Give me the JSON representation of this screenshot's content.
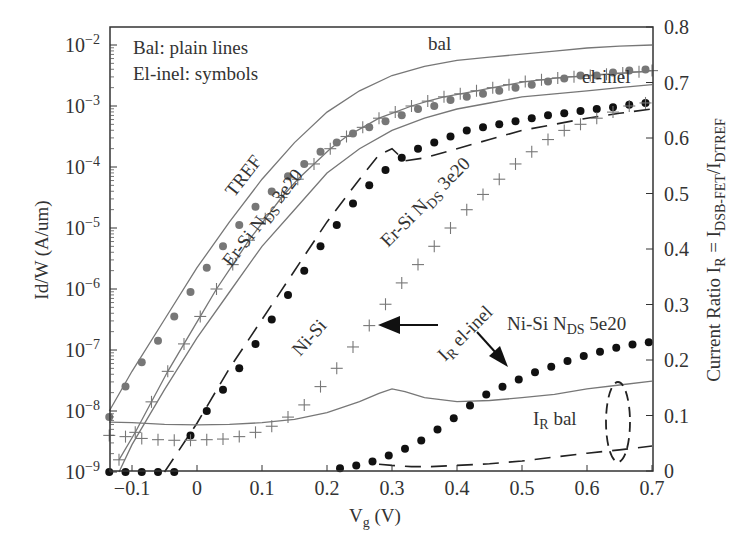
{
  "chart_data": {
    "type": "line",
    "title": "",
    "legend_note": [
      "Bal: plain lines",
      "El-inel: symbols"
    ],
    "xlabel": "V_g (V)",
    "ylabel_left": "Id/W (A/um)",
    "ylabel_right": "Current Ratio I_R = I_DSB-FET/I_DTREF",
    "xlim": [
      -0.135,
      0.7
    ],
    "ylim_left_log": [
      1e-09,
      0.01
    ],
    "ylim_right": [
      0,
      0.8
    ],
    "x_ticks": [
      -0.1,
      0,
      0.1,
      0.2,
      0.3,
      0.4,
      0.5,
      0.6,
      0.7
    ],
    "x_tick_labels": [
      "−0.1",
      "0",
      "0.1",
      "0.2",
      "0.3",
      "0.4",
      "0.5",
      "0.6",
      "0.7"
    ],
    "y_left_ticks": [
      -2,
      -3,
      -4,
      -5,
      -6,
      -7,
      -8,
      -9
    ],
    "y_right_ticks": [
      0,
      0.1,
      0.2,
      0.3,
      0.4,
      0.5,
      0.6,
      0.7,
      0.8
    ],
    "y_right_tick_labels": [
      "0",
      "0.1",
      "0.2",
      "0.3",
      "0.4",
      "0.5",
      "0.6",
      "0.7",
      "0.8"
    ],
    "grid": false,
    "series": [
      {
        "name": "TREF bal",
        "axis": "left",
        "style": "solid",
        "color": "#777777",
        "x": [
          -0.135,
          -0.1,
          -0.05,
          0,
          0.05,
          0.1,
          0.15,
          0.2,
          0.25,
          0.3,
          0.35,
          0.4,
          0.45,
          0.5,
          0.55,
          0.6,
          0.65,
          0.7
        ],
        "log10y": [
          -8.0,
          -7.35,
          -6.5,
          -5.65,
          -4.9,
          -4.2,
          -3.6,
          -3.1,
          -2.75,
          -2.5,
          -2.35,
          -2.25,
          -2.2,
          -2.15,
          -2.1,
          -2.05,
          -2.02,
          -2.0
        ]
      },
      {
        "name": "TREF el-inel",
        "axis": "left",
        "style": "dot-grey",
        "color": "#777777",
        "x": [
          -0.135,
          -0.11,
          -0.085,
          -0.06,
          -0.035,
          -0.01,
          0.015,
          0.04,
          0.065,
          0.09,
          0.115,
          0.14,
          0.165,
          0.19,
          0.215,
          0.24,
          0.265,
          0.29,
          0.315,
          0.34,
          0.365,
          0.39,
          0.415,
          0.44,
          0.465,
          0.49,
          0.515,
          0.54,
          0.565,
          0.59,
          0.615,
          0.64,
          0.665,
          0.69
        ],
        "log10y": [
          -8.1,
          -7.6,
          -7.2,
          -6.85,
          -6.45,
          -6.05,
          -5.65,
          -5.3,
          -4.95,
          -4.65,
          -4.4,
          -4.15,
          -3.95,
          -3.75,
          -3.6,
          -3.45,
          -3.35,
          -3.25,
          -3.15,
          -3.05,
          -3.0,
          -2.9,
          -2.85,
          -2.8,
          -2.75,
          -2.7,
          -2.65,
          -2.6,
          -2.55,
          -2.5,
          -2.5,
          -2.45,
          -2.42,
          -2.4
        ]
      },
      {
        "name": "Er-Si N_DS 3e20 (high) bal",
        "axis": "left",
        "style": "solid",
        "color": "#777777",
        "x": [
          -0.12,
          -0.1,
          -0.05,
          0,
          0.05,
          0.1,
          0.15,
          0.2,
          0.25,
          0.3,
          0.35,
          0.4,
          0.45,
          0.5,
          0.55,
          0.6,
          0.65,
          0.7
        ],
        "log10y": [
          -9.0,
          -8.55,
          -7.65,
          -6.8,
          -6.05,
          -5.3,
          -4.7,
          -4.1,
          -3.7,
          -3.4,
          -3.2,
          -3.05,
          -2.95,
          -2.85,
          -2.8,
          -2.75,
          -2.7,
          -2.65
        ]
      },
      {
        "name": "Er-Si N_DS 3e20 (high) el-inel",
        "axis": "left",
        "style": "plus-line",
        "color": "#777777",
        "x": [
          -0.12,
          -0.095,
          -0.07,
          -0.045,
          -0.02,
          0.005,
          0.03,
          0.055,
          0.08,
          0.105,
          0.13,
          0.155,
          0.18,
          0.205,
          0.23,
          0.255,
          0.28,
          0.305,
          0.33,
          0.355,
          0.38,
          0.405,
          0.43,
          0.455,
          0.48,
          0.505,
          0.53,
          0.555,
          0.58,
          0.605,
          0.63,
          0.655,
          0.68,
          0.7
        ],
        "log10y": [
          -8.8,
          -8.35,
          -7.85,
          -7.35,
          -6.9,
          -6.45,
          -6.0,
          -5.6,
          -5.2,
          -4.85,
          -4.5,
          -4.2,
          -3.95,
          -3.7,
          -3.5,
          -3.35,
          -3.2,
          -3.1,
          -3.0,
          -2.92,
          -2.85,
          -2.8,
          -2.75,
          -2.7,
          -2.65,
          -2.6,
          -2.57,
          -2.54,
          -2.52,
          -2.5,
          -2.48,
          -2.46,
          -2.44,
          -2.42
        ]
      },
      {
        "name": "Ni-Si bal",
        "axis": "left",
        "style": "dashed",
        "color": "#222222",
        "x": [
          -0.05,
          0,
          0.05,
          0.1,
          0.15,
          0.2,
          0.25,
          0.28,
          0.3,
          0.32,
          0.35,
          0.4,
          0.45,
          0.5,
          0.55,
          0.6,
          0.65,
          0.7
        ],
        "log10y": [
          -9.0,
          -8.2,
          -7.3,
          -6.5,
          -5.7,
          -4.9,
          -4.2,
          -3.8,
          -3.7,
          -3.9,
          -3.85,
          -3.7,
          -3.55,
          -3.4,
          -3.3,
          -3.2,
          -3.12,
          -3.05
        ]
      },
      {
        "name": "Ni-Si el-inel",
        "axis": "left",
        "style": "dot-black",
        "color": "#111111",
        "x": [
          -0.135,
          -0.11,
          -0.085,
          -0.06,
          -0.035,
          -0.01,
          0.015,
          0.04,
          0.065,
          0.09,
          0.115,
          0.14,
          0.165,
          0.19,
          0.215,
          0.24,
          0.265,
          0.29,
          0.315,
          0.34,
          0.365,
          0.39,
          0.415,
          0.44,
          0.465,
          0.49,
          0.515,
          0.54,
          0.565,
          0.59,
          0.615,
          0.64,
          0.665,
          0.69
        ],
        "log10y": [
          -9.0,
          -9.0,
          -9.0,
          -9.0,
          -9.0,
          -8.4,
          -8.0,
          -7.65,
          -7.3,
          -6.9,
          -6.5,
          -6.1,
          -5.7,
          -5.3,
          -4.95,
          -4.6,
          -4.3,
          -4.05,
          -3.85,
          -3.7,
          -3.6,
          -3.5,
          -3.4,
          -3.35,
          -3.3,
          -3.25,
          -3.2,
          -3.15,
          -3.12,
          -3.08,
          -3.05,
          -3.02,
          -2.98,
          -2.95
        ]
      },
      {
        "name": "Er-Si N_DS 3e20 (low) el-inel",
        "axis": "left",
        "style": "plus",
        "color": "#777777",
        "x": [
          -0.135,
          -0.11,
          -0.085,
          -0.06,
          -0.035,
          -0.01,
          0.015,
          0.04,
          0.065,
          0.09,
          0.115,
          0.14,
          0.165,
          0.19,
          0.215,
          0.24,
          0.265,
          0.29,
          0.315,
          0.34,
          0.365,
          0.39,
          0.415,
          0.44,
          0.465,
          0.49,
          0.515,
          0.54,
          0.565,
          0.59,
          0.615,
          0.64,
          0.665,
          0.69
        ],
        "log10y": [
          -8.4,
          -8.42,
          -8.45,
          -8.47,
          -8.48,
          -8.48,
          -8.47,
          -8.46,
          -8.42,
          -8.35,
          -8.25,
          -8.1,
          -7.9,
          -7.6,
          -7.3,
          -6.95,
          -6.6,
          -6.25,
          -5.9,
          -5.6,
          -5.3,
          -5.0,
          -4.7,
          -4.45,
          -4.2,
          -3.95,
          -3.75,
          -3.55,
          -3.4,
          -3.3,
          -3.2,
          -3.1,
          -3.0,
          -2.95
        ]
      },
      {
        "name": "I_R bal (solid)",
        "axis": "right",
        "style": "solid",
        "color": "#777777",
        "x": [
          -0.135,
          -0.1,
          -0.05,
          0,
          0.05,
          0.1,
          0.15,
          0.2,
          0.25,
          0.28,
          0.3,
          0.32,
          0.35,
          0.4,
          0.45,
          0.5,
          0.55,
          0.6,
          0.65,
          0.7
        ],
        "r": [
          0.088,
          0.087,
          0.084,
          0.083,
          0.084,
          0.087,
          0.093,
          0.105,
          0.125,
          0.14,
          0.148,
          0.143,
          0.132,
          0.125,
          0.127,
          0.132,
          0.138,
          0.148,
          0.155,
          0.162
        ]
      },
      {
        "name": "I_R bal (dashed, Ni-Si)",
        "axis": "right",
        "style": "dashed",
        "color": "#222222",
        "x": [
          0.28,
          0.3,
          0.33,
          0.36,
          0.4,
          0.45,
          0.5,
          0.55,
          0.6,
          0.65,
          0.7
        ],
        "r": [
          0.012,
          0.01,
          0.008,
          0.008,
          0.01,
          0.013,
          0.018,
          0.025,
          0.032,
          0.038,
          0.045
        ]
      },
      {
        "name": "I_R el-inel (Ni-Si N_DS 5e20)",
        "axis": "right",
        "style": "dot-black",
        "color": "#111111",
        "x": [
          0.22,
          0.245,
          0.27,
          0.295,
          0.32,
          0.345,
          0.37,
          0.395,
          0.42,
          0.445,
          0.47,
          0.495,
          0.52,
          0.545,
          0.57,
          0.595,
          0.62,
          0.645,
          0.67,
          0.695
        ],
        "r": [
          0.005,
          0.01,
          0.017,
          0.028,
          0.04,
          0.055,
          0.075,
          0.095,
          0.118,
          0.138,
          0.152,
          0.165,
          0.178,
          0.188,
          0.198,
          0.207,
          0.215,
          0.222,
          0.228,
          0.232
        ]
      }
    ],
    "annotations": [
      {
        "text": "bal",
        "x": 0.43,
        "log10y": -2.05
      },
      {
        "text": "el-inel",
        "x": 0.6,
        "log10y": -2.35
      },
      {
        "text": "TREF",
        "rotate": -52
      },
      {
        "text": "Er-Si N_DS 3e20",
        "rotate": -52
      },
      {
        "text": "Er-Si N_DS 3e20",
        "rotate": -45
      },
      {
        "text": "Ni-Si",
        "rotate": -48
      },
      {
        "text": "I_R el-inel",
        "rotate": -45
      },
      {
        "text": "Ni-Si N_DS 5e20"
      },
      {
        "text": "I_R bal"
      }
    ]
  },
  "labels": {
    "legend_line1": "Bal: plain lines",
    "legend_line2": "El-inel: symbols",
    "bal": "bal",
    "el_inel": "el-inel",
    "tref": "TREF",
    "ersi_main": "Er-Si N",
    "ersi_sub": "DS",
    "ersi_tail": " 3e20",
    "nisi": "Ni-Si",
    "ir_el_I": "I",
    "ir_el_sub": "R",
    "ir_el_tail": " el-inel",
    "nisi5_main": "Ni-Si N",
    "nisi5_sub": "DS",
    "nisi5_tail": " 5e20",
    "ir_bal_I": "I",
    "ir_bal_sub": "R",
    "ir_bal_tail": " bal",
    "xlabel_main": "V",
    "xlabel_sub": "g",
    "xlabel_tail": " (V)",
    "ylabel_left": "Id/W (A/um)",
    "ylabel_right_main": "Current Ratio I",
    "ylabel_right_sub1": "R",
    "ylabel_right_mid": " = I",
    "ylabel_right_sub2": "DSB-FET",
    "ylabel_right_slash": "/I",
    "ylabel_right_sub3": "DTREF"
  }
}
